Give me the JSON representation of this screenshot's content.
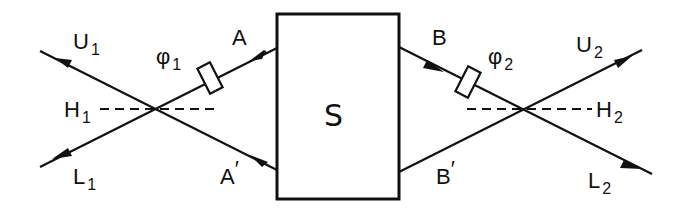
{
  "diagram": {
    "source": {
      "label": "S"
    },
    "left": {
      "beam_upper_in": {
        "label": "A"
      },
      "beam_lower_in": {
        "label": "A",
        "prime": "′"
      },
      "phase": {
        "symbol": "φ",
        "sub": "1"
      },
      "splitter": {
        "label": "H",
        "sub": "1"
      },
      "out_upper": {
        "label": "U",
        "sub": "1"
      },
      "out_lower": {
        "label": "L",
        "sub": "1"
      }
    },
    "right": {
      "beam_upper_in": {
        "label": "B"
      },
      "beam_lower_in": {
        "label": "B",
        "prime": "′"
      },
      "phase": {
        "symbol": "φ",
        "sub": "2"
      },
      "splitter": {
        "label": "H",
        "sub": "2"
      },
      "out_upper": {
        "label": "U",
        "sub": "2"
      },
      "out_lower": {
        "label": "L",
        "sub": "2"
      }
    },
    "colors": {
      "ink": "#111111",
      "background": "#ffffff"
    }
  }
}
